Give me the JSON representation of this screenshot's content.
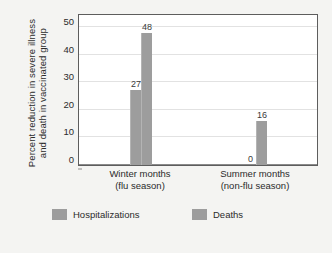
{
  "chart_data": {
    "type": "bar",
    "title": "",
    "xlabel": "",
    "ylabel_line1": "Percent reduction in severe illness",
    "ylabel_line2": "and death in vaccinated group",
    "categories": [
      "Winter months\n(flu season)",
      "Summer months\n(non-flu season)"
    ],
    "category_labels": [
      {
        "line1": "Winter months",
        "line2": "(flu season)"
      },
      {
        "line1": "Summer months",
        "line2": "(non-flu season)"
      }
    ],
    "series": [
      {
        "name": "Hospitalizations",
        "values": [
          27,
          0
        ]
      },
      {
        "name": "Deaths",
        "values": [
          48,
          16
        ]
      }
    ],
    "ylim": [
      0,
      50
    ],
    "yticks": [
      0,
      10,
      20,
      30,
      40,
      50
    ],
    "ytick_labels": [
      "0",
      "10",
      "20",
      "30",
      "40",
      "50"
    ],
    "grid": true,
    "legend_position": "bottom",
    "bar_color": "#9d9d9d",
    "data_labels": [
      "27",
      "48",
      "0",
      "16"
    ]
  },
  "legend": {
    "items": [
      {
        "label": "Hospitalizations",
        "color": "#9d9d9d"
      },
      {
        "label": "Deaths",
        "color": "#9d9d9d"
      }
    ]
  }
}
